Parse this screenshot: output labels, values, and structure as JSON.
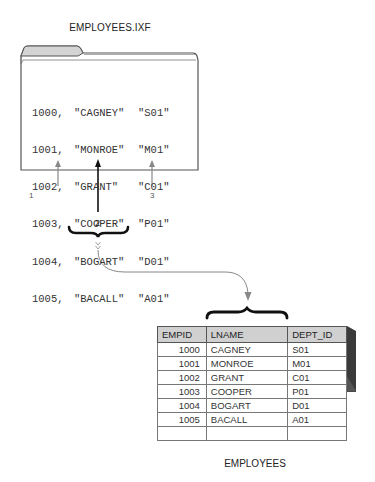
{
  "file": {
    "title": "EMPLOYEES.IXF",
    "rows": [
      {
        "id": "1000,",
        "name": "\"CAGNEY\"",
        "dept": "\"S01\""
      },
      {
        "id": "1001,",
        "name": "\"MONROE\"",
        "dept": "\"M01\""
      },
      {
        "id": "1002,",
        "name": "\"GRANT\"",
        "dept": "\"C01\""
      },
      {
        "id": "1003,",
        "name": "\"COOPER\"",
        "dept": "\"P01\""
      },
      {
        "id": "1004,",
        "name": "\"BOGART\"",
        "dept": "\"D01\""
      },
      {
        "id": "1005,",
        "name": "\"BACALL\"",
        "dept": "\"A01\""
      }
    ]
  },
  "callouts": {
    "label_1": "1",
    "label_2": "2",
    "label_3": "3"
  },
  "table": {
    "caption": "EMPLOYEES",
    "headers": [
      "EMPID",
      "LNAME",
      "DEPT_ID"
    ],
    "rows": [
      [
        "1000",
        "CAGNEY",
        "S01"
      ],
      [
        "1001",
        "MONROE",
        "M01"
      ],
      [
        "1002",
        "GRANT",
        "C01"
      ],
      [
        "1003",
        "COOPER",
        "P01"
      ],
      [
        "1004",
        "BOGART",
        "D01"
      ],
      [
        "1005",
        "BACALL",
        "A01"
      ],
      [
        "",
        "",
        ""
      ]
    ]
  },
  "colors": {
    "folder_tab": "#d4d4d4",
    "folder_outline": "#555555",
    "table_header": "#d0d0d0",
    "table_shadow": "#3a3a3a",
    "connector": "#888888"
  }
}
